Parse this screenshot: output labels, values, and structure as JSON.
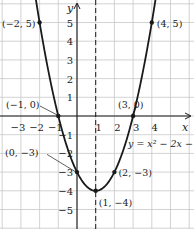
{
  "chart_data": {
    "type": "line",
    "title": "",
    "equation_label": "y = x² − 2x − 3",
    "xlabel": "x",
    "ylabel": "y",
    "xlim": [
      -4,
      5
    ],
    "ylim": [
      -6,
      5.5
    ],
    "grid": true,
    "x_ticks": [
      "−3",
      "−2",
      "−1",
      "1",
      "2",
      "3",
      "4"
    ],
    "x_tick_values": [
      -3,
      -2,
      -1,
      1,
      2,
      3,
      4
    ],
    "y_ticks": [
      "5",
      "4",
      "3",
      "2",
      "1",
      "−1",
      "−2",
      "−3",
      "−4",
      "−5"
    ],
    "y_tick_values": [
      5,
      4,
      3,
      2,
      1,
      -1,
      -2,
      -3,
      -4,
      -5
    ],
    "axis_of_symmetry": {
      "x": 1,
      "style": "dashed"
    },
    "series": [
      {
        "name": "y = x^2 - 2x - 3",
        "function": "x^2 - 2x - 3",
        "x": [
          -2,
          -1,
          0,
          1,
          2,
          3,
          4
        ],
        "y": [
          5,
          0,
          -3,
          -4,
          -3,
          0,
          5
        ]
      }
    ],
    "points": [
      {
        "label": "(−2, 5)",
        "x": -2,
        "y": 5
      },
      {
        "label": "(−1, 0)",
        "x": -1,
        "y": 0
      },
      {
        "label": "(0, −3)",
        "x": 0,
        "y": -3
      },
      {
        "label": "(1, −4)",
        "x": 1,
        "y": -4
      },
      {
        "label": "(2, −3)",
        "x": 2,
        "y": -3
      },
      {
        "label": "(3, 0)",
        "x": 3,
        "y": 0
      },
      {
        "label": "(4, 5)",
        "x": 4,
        "y": 5
      }
    ]
  },
  "colors": {
    "curve": "#1a1a1a",
    "grid": "#c8c8c8",
    "axis": "#1a1a1a",
    "background": "#ffffff"
  }
}
